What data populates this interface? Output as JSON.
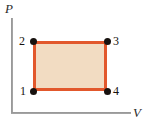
{
  "figure": {
    "type": "pv-diagram",
    "background_color": "#ffffff"
  },
  "axes": {
    "vertical": {
      "label": "P",
      "name": "pressure-axis",
      "color": "#8e8e8e"
    },
    "horizontal": {
      "label": "V",
      "name": "volume-axis",
      "color": "#8e8e8e"
    }
  },
  "cycle": {
    "shape": "rectangle",
    "fill_color": "#f2dcc2",
    "stroke_color": "#e2582c",
    "vertex_color": "#17120f",
    "states": [
      {
        "label": "1",
        "position": "bottom-left"
      },
      {
        "label": "2",
        "position": "top-left"
      },
      {
        "label": "3",
        "position": "top-right"
      },
      {
        "label": "4",
        "position": "bottom-right"
      }
    ]
  },
  "chart_data": {
    "type": "line",
    "title": "",
    "xlabel": "V",
    "ylabel": "P",
    "grid": false,
    "legend": null,
    "xlim": [
      0,
      1
    ],
    "ylim": [
      0,
      1
    ],
    "series": [
      {
        "name": "thermodynamic-cycle",
        "closed": true,
        "points": [
          {
            "label": "1",
            "x": 0.18,
            "y": 0.23
          },
          {
            "label": "2",
            "x": 0.18,
            "y": 0.75
          },
          {
            "label": "3",
            "x": 0.8,
            "y": 0.75
          },
          {
            "label": "4",
            "x": 0.8,
            "y": 0.23
          }
        ]
      }
    ],
    "annotations": [
      "1",
      "2",
      "3",
      "4"
    ]
  }
}
